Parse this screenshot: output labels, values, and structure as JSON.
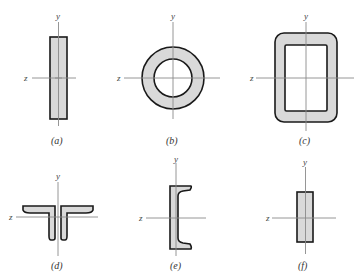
{
  "figure": {
    "fill_color": "#d9d9d9",
    "stroke_color": "#1a1a1a",
    "axis_color": "#8a8a8a",
    "panels": [
      {
        "id": "a",
        "caption": "(a)",
        "shape": "tall-thin-rectangle",
        "y_label": "y",
        "z_label": "z"
      },
      {
        "id": "b",
        "caption": "(b)",
        "shape": "circular-tube",
        "y_label": "y",
        "z_label": "z"
      },
      {
        "id": "c",
        "caption": "(c)",
        "shape": "rounded-rectangular-tube",
        "y_label": "y",
        "z_label": "z"
      },
      {
        "id": "d",
        "caption": "(d)",
        "shape": "double-angle-section",
        "y_label": "y",
        "z_label": "z"
      },
      {
        "id": "e",
        "caption": "(e)",
        "shape": "channel-section",
        "y_label": "y",
        "z_label": "z"
      },
      {
        "id": "f",
        "caption": "(f)",
        "shape": "rectangle",
        "y_label": "y",
        "z_label": "z"
      }
    ]
  }
}
